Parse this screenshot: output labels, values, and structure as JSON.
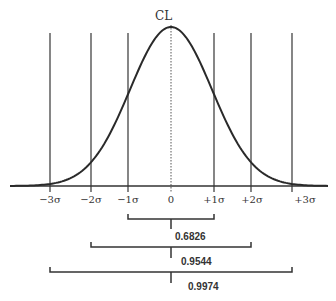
{
  "diagram": {
    "center_label": "CL",
    "axis_labels": [
      "−3σ",
      "−2σ",
      "−1σ",
      "0",
      "+1σ",
      "+2σ",
      "+3σ"
    ],
    "brackets": [
      {
        "range": "±1σ",
        "probability": "0.6826"
      },
      {
        "range": "±2σ",
        "probability": "0.9544"
      },
      {
        "range": "±3σ",
        "probability": "0.9974"
      }
    ],
    "colors": {
      "line": "#333333",
      "curve": "#2a2a2a",
      "background": "#ffffff"
    }
  }
}
